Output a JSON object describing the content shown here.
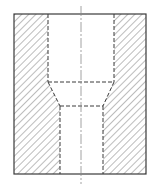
{
  "diagram": {
    "type": "sectional-view",
    "colors": {
      "background": "#ffffff",
      "line": "#3a3a3a",
      "hatch": "#6a6a6a",
      "centerline": "#8a8a8a"
    },
    "outline": {
      "x": 14,
      "y": 14,
      "width": 132,
      "height": 160
    },
    "upper_bore": {
      "left": 48,
      "right": 114,
      "top": 14,
      "bottom": 82
    },
    "taper": {
      "top": 82,
      "bottom": 106
    },
    "lower_bore": {
      "left": 60,
      "right": 103,
      "top": 106,
      "bottom": 174
    },
    "centerline": {
      "x": 81,
      "y1": 6,
      "y2": 184
    }
  }
}
